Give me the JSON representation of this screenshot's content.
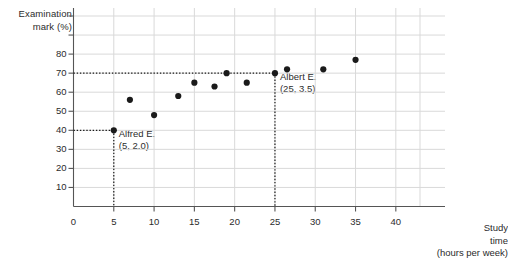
{
  "chart_data": {
    "type": "scatter",
    "title": "",
    "xlabel": "Study time (hours per week)",
    "ylabel": "Examination mark (%)",
    "ylabel_lines": [
      "Examination",
      "mark (%)"
    ],
    "xlabel_lines": [
      "Study",
      "time",
      "(hours per week)"
    ],
    "xlim": [
      0,
      43
    ],
    "ylim": [
      0,
      100
    ],
    "x_ticks": [
      0,
      5,
      10,
      15,
      20,
      25,
      30,
      35,
      40
    ],
    "x_tick_labels": [
      "0",
      "5",
      "10",
      "15",
      "20",
      "25",
      "30",
      "35",
      "40"
    ],
    "y_ticks": [
      10,
      20,
      30,
      40,
      50,
      60,
      70,
      80,
      90,
      100
    ],
    "y_tick_labels": [
      "10",
      "20",
      "30",
      "40",
      "50",
      "60",
      "70",
      "80",
      "",
      ""
    ],
    "grid": true,
    "grid_color": "#d9d9d9",
    "axis_color": "#555555",
    "point_color": "#1a1a1a",
    "points": [
      {
        "x": 5,
        "y": 40
      },
      {
        "x": 7,
        "y": 56
      },
      {
        "x": 10,
        "y": 48
      },
      {
        "x": 13,
        "y": 58
      },
      {
        "x": 15,
        "y": 65
      },
      {
        "x": 17.5,
        "y": 63
      },
      {
        "x": 19,
        "y": 70
      },
      {
        "x": 21.5,
        "y": 65
      },
      {
        "x": 25,
        "y": 70
      },
      {
        "x": 26.5,
        "y": 72
      },
      {
        "x": 31,
        "y": 72
      },
      {
        "x": 35,
        "y": 77
      }
    ],
    "annotations": [
      {
        "name": "alfred",
        "label_lines": [
          "Alfred E.",
          "(5, 2.0)"
        ],
        "point": {
          "x": 5,
          "y": 40
        },
        "guide": "dotted"
      },
      {
        "name": "albert",
        "label_lines": [
          "Albert E.",
          "(25, 3.5)"
        ],
        "point": {
          "x": 25,
          "y": 70
        },
        "guide": "dotted"
      }
    ]
  },
  "annotation_alfred": {
    "line1": "Alfred E.",
    "line2": "(5, 2.0)"
  },
  "annotation_albert": {
    "line1": "Albert E.",
    "line2": "(25, 3.5)"
  },
  "axis": {
    "y_title_line1": "Examination",
    "y_title_line2": "mark (%)",
    "x_title_line1": "Study",
    "x_title_line2": "time",
    "x_title_line3": "(hours per week)"
  }
}
